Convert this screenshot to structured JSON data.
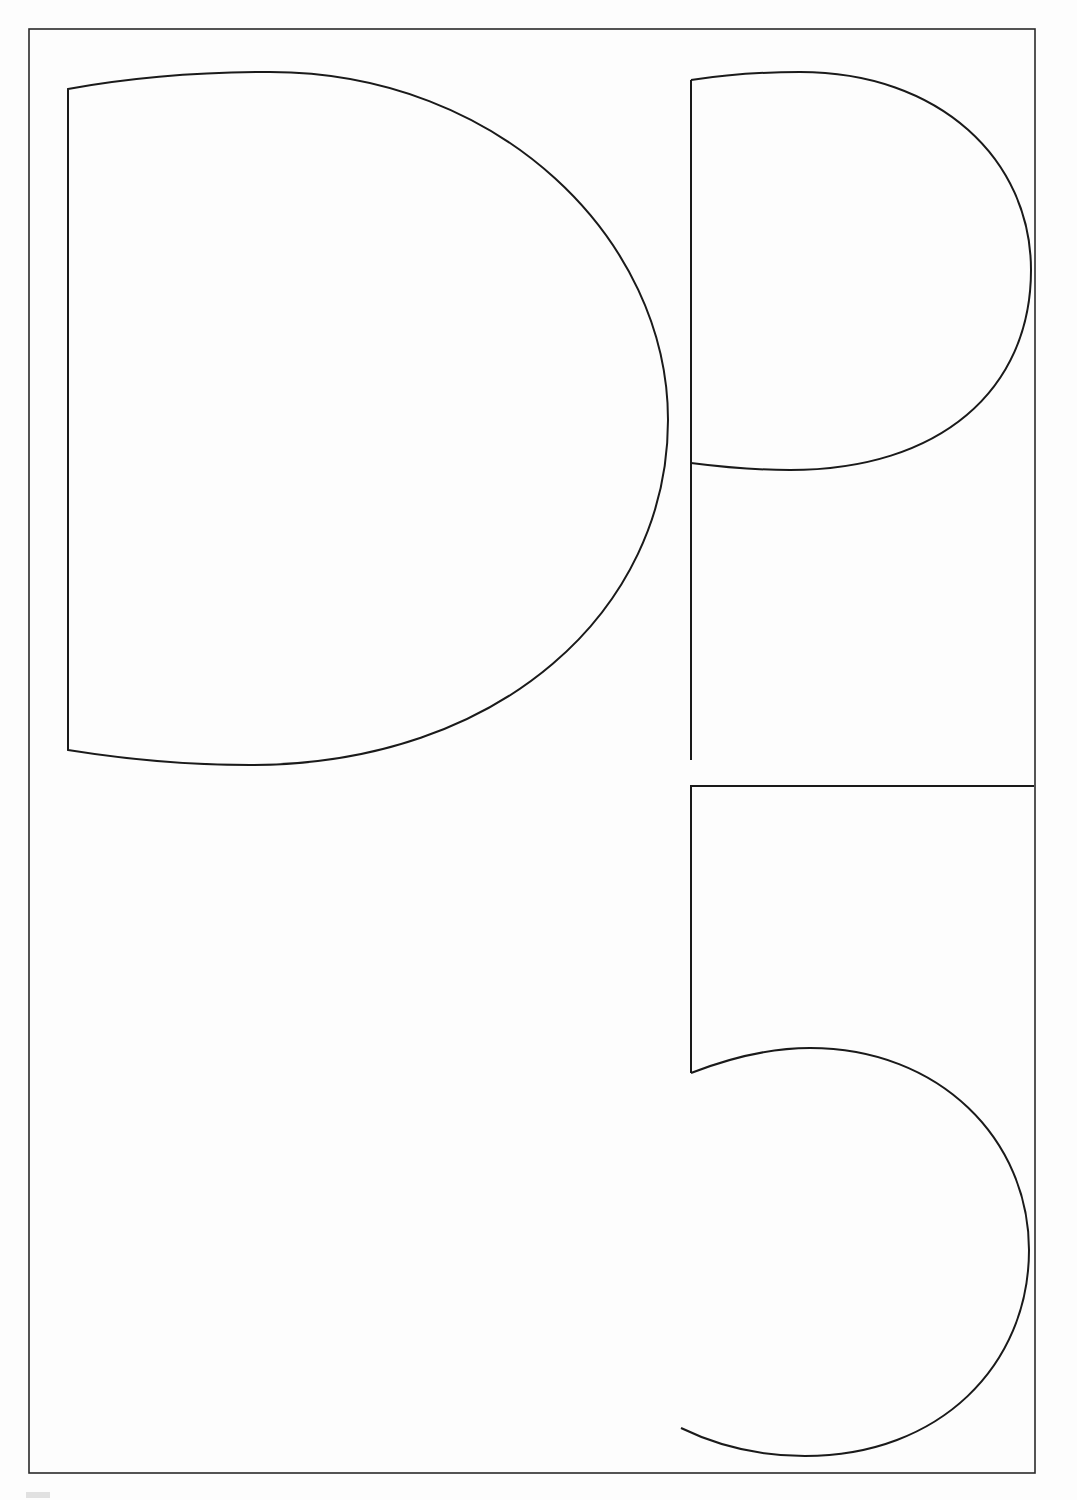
{
  "page": {
    "description": "Line-art letterforms D, P and 5 inside a rectangular frame",
    "glyphs": [
      "D",
      "P",
      "5"
    ],
    "stroke_color": "#1a1a1a",
    "background_color": "#fdfdfd",
    "frame": {
      "x": 29,
      "y": 29,
      "width": 1006,
      "height": 1444
    }
  }
}
